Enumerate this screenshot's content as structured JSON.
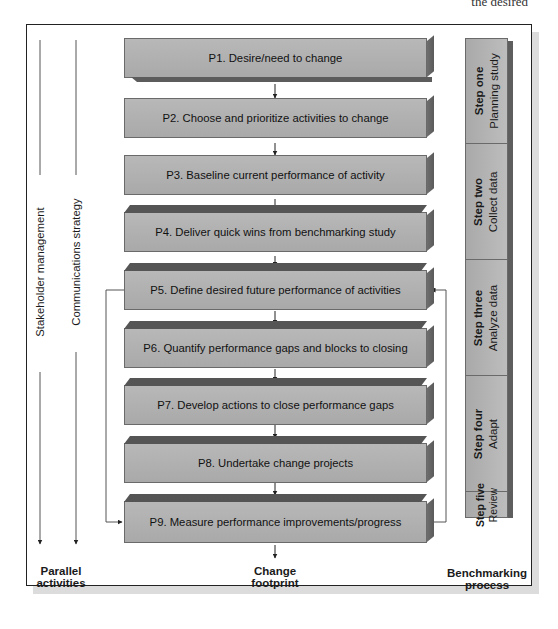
{
  "top_text_fragment": "the desired",
  "parallel_activities": {
    "lines": [
      {
        "label": "Stakeholder management"
      },
      {
        "label": "Communications strategy"
      }
    ],
    "footer_label_line1": "Parallel",
    "footer_label_line2": "activities"
  },
  "change_footprint": {
    "steps": [
      {
        "id": "P1",
        "label": "P1. Desire/need to change"
      },
      {
        "id": "P2",
        "label": "P2. Choose and prioritize activities to change"
      },
      {
        "id": "P3",
        "label": "P3. Baseline current performance of activity"
      },
      {
        "id": "P4",
        "label": "P4. Deliver quick wins from benchmarking study"
      },
      {
        "id": "P5",
        "label": "P5. Define desired future performance of activities"
      },
      {
        "id": "P6",
        "label": "P6. Quantify performance gaps and blocks to closing"
      },
      {
        "id": "P7",
        "label": "P7. Develop actions to close performance gaps"
      },
      {
        "id": "P8",
        "label": "P8. Undertake change projects"
      },
      {
        "id": "P9",
        "label": "P9. Measure performance improvements/progress"
      }
    ],
    "feedback_loops": [
      {
        "from": "P5",
        "to": "P9",
        "side": "left"
      },
      {
        "from": "P9",
        "to": "P5",
        "side": "right"
      }
    ],
    "footer_label_line1": "Change",
    "footer_label_line2": "footprint"
  },
  "benchmarking_process": {
    "steps": [
      {
        "step": "Step one",
        "name": "Planning study"
      },
      {
        "step": "Step two",
        "name": "Collect data"
      },
      {
        "step": "Step three",
        "name": "Analyze data"
      },
      {
        "step": "Step four",
        "name": "Adapt"
      },
      {
        "step": "Step five",
        "name": "Review"
      }
    ],
    "footer_label_line1": "Benchmarking",
    "footer_label_line2": "process"
  },
  "colors": {
    "box_fill": "#b2b2b2",
    "box_top": "#555555",
    "box_side": "#626262",
    "frame": "#222222",
    "frame_shadow": "#dcdcdc"
  }
}
